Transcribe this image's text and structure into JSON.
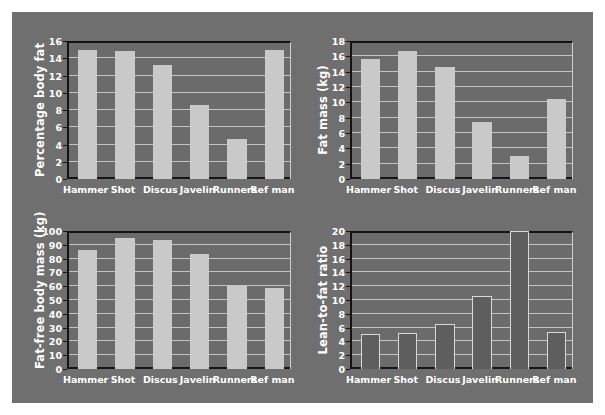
{
  "figure": {
    "background_color": "#6f6f6f",
    "bar_color_light": "#c9c9c9",
    "bar_color_dark": "#5e5e5e",
    "categories": [
      "Hammer",
      "Shot",
      "Discus",
      "Javelin",
      "Runners",
      "Ref man"
    ]
  },
  "chart_data": [
    {
      "type": "bar",
      "id": "percentage-body-fat",
      "position": "top-left",
      "title": "",
      "xlabel": "",
      "ylabel": "Percentage body fat",
      "categories": [
        "Hammer",
        "Shot",
        "Discus",
        "Javelin",
        "Runners",
        "Ref man"
      ],
      "values": [
        15.0,
        14.8,
        13.2,
        8.6,
        4.6,
        15.0
      ],
      "ylim": [
        0,
        16
      ],
      "ytick_step": 2,
      "yticks": [
        0,
        2,
        4,
        6,
        8,
        10,
        12,
        14,
        16
      ],
      "grid": true,
      "legend": false,
      "bar_style": "light"
    },
    {
      "type": "bar",
      "id": "fat-mass",
      "position": "top-right",
      "title": "",
      "xlabel": "",
      "ylabel": "Fat mass (kg)",
      "categories": [
        "Hammer",
        "Shot",
        "Discus",
        "Javelin",
        "Runners",
        "Ref man"
      ],
      "values": [
        15.6,
        16.7,
        14.6,
        7.4,
        3.0,
        10.5
      ],
      "ylim": [
        0,
        18
      ],
      "ytick_step": 2,
      "yticks": [
        0,
        2,
        4,
        6,
        8,
        10,
        12,
        14,
        16,
        18
      ],
      "grid": true,
      "legend": false,
      "bar_style": "light"
    },
    {
      "type": "bar",
      "id": "fat-free-body-mass",
      "position": "bottom-left",
      "title": "",
      "xlabel": "",
      "ylabel": "Fat-free body mass (kg)",
      "categories": [
        "Hammer",
        "Shot",
        "Discus",
        "Javelin",
        "Runners",
        "Ref man"
      ],
      "values": [
        86.5,
        95.0,
        93.5,
        83.0,
        60.0,
        59.0
      ],
      "ylim": [
        0,
        100
      ],
      "ytick_step": 10,
      "yticks": [
        0,
        10,
        20,
        30,
        40,
        50,
        60,
        70,
        80,
        90,
        100
      ],
      "grid": true,
      "legend": false,
      "bar_style": "light"
    },
    {
      "type": "bar",
      "id": "lean-to-fat-ratio",
      "position": "bottom-right",
      "title": "",
      "xlabel": "",
      "ylabel": "Lean-to-fat ratio",
      "categories": [
        "Hammer",
        "Shot",
        "Discus",
        "Javelin",
        "Runners",
        "Ref man"
      ],
      "values": [
        5.1,
        5.2,
        6.5,
        10.6,
        20.0,
        5.4
      ],
      "ylim": [
        0,
        20
      ],
      "ytick_step": 2,
      "yticks": [
        0,
        2,
        4,
        6,
        8,
        10,
        12,
        14,
        16,
        18,
        20
      ],
      "grid": true,
      "legend": false,
      "bar_style": "dark"
    }
  ]
}
